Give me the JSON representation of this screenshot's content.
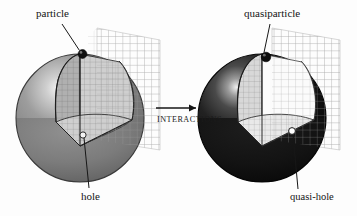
{
  "figure": {
    "caption_labels": {
      "particle": "particle",
      "hole": "hole",
      "quasiparticle": "quasiparticle",
      "quasi_hole": "quasi-hole",
      "interactions": "INTERACTIONS"
    },
    "colors": {
      "background": "#fdfdfd",
      "left_sphere_gray": "#8e8e8e",
      "left_sphere_dark": "#6e6e6e",
      "left_sphere_highlight": "#f2f2f2",
      "right_sphere_black": "#121212",
      "right_sphere_highlight": "#e8e8e8",
      "mesh_line": "#9a9a9a",
      "interior_mesh": "#b4b4b4",
      "marker_dark": "#101010",
      "marker_light": "#ffffff",
      "outline": "#2a2a2a",
      "text": "#141414"
    },
    "panels": [
      {
        "id": "left-panel",
        "name": "non-interacting-fermi-sphere",
        "sphere_fill": "medium-gray",
        "cutaway": "octant-wedge",
        "markers": [
          {
            "name": "particle",
            "kind": "filled-dark-dot",
            "position": "top-of-sphere"
          },
          {
            "name": "hole",
            "kind": "open-light-dot",
            "position": "interior-cut-face"
          }
        ]
      },
      {
        "id": "right-panel",
        "name": "interacting-quasiparticle-sphere",
        "sphere_fill": "black",
        "cutaway": "octant-wedge",
        "markers": [
          {
            "name": "quasiparticle",
            "kind": "filled-dark-dot",
            "position": "top-of-sphere"
          },
          {
            "name": "quasi-hole",
            "kind": "open-light-circle",
            "position": "interior-cut-face"
          }
        ]
      }
    ],
    "arrow": {
      "name": "interactions-arrow",
      "direction": "left-to-right",
      "label": "INTERACTIONS"
    }
  }
}
